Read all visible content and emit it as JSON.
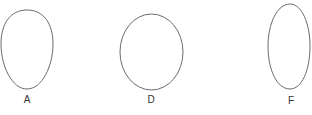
{
  "figure": {
    "width": 312,
    "height": 115,
    "background": "#ffffff",
    "stroke_color": "#6b6b6b",
    "label_color": "#333333",
    "shapes": [
      {
        "id": "A",
        "label": "A",
        "kind": "egg-wide-top",
        "path": "M27,10 C44,10 53,24 53,44 C53,66 42,89 27,89 C12,89 1,66 1,44 C1,24 10,10 27,10 Z",
        "label_x": 27,
        "label_y": 103
      },
      {
        "id": "D",
        "label": "D",
        "kind": "ellipse",
        "cx": 151.5,
        "cy": 52,
        "rx": 31.5,
        "ry": 38,
        "label_x": 151,
        "label_y": 103
      },
      {
        "id": "F",
        "label": "F",
        "kind": "egg-narrow-top",
        "path": "M290,4 C302,4 310,24 310,46 C310,70 302,89 290,89 C277,89 268,70 268,46 C268,24 277,4 290,4 Z",
        "label_x": 291,
        "label_y": 104
      }
    ]
  }
}
